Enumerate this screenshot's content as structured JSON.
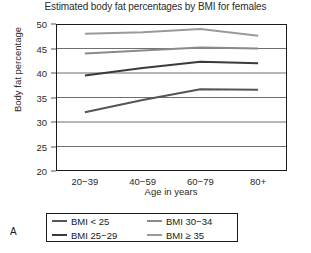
{
  "panel": {
    "letter": "A"
  },
  "chart_data": {
    "type": "line",
    "title": "Estimated body fat percentages by BMI for females",
    "xlabel": "Age in years",
    "ylabel": "Body fat percentage",
    "categories": [
      "20−39",
      "40−59",
      "60−79",
      "80+"
    ],
    "ylim": [
      20,
      50
    ],
    "yticks": [
      20,
      25,
      30,
      35,
      40,
      45,
      50
    ],
    "grid": "horizontal",
    "legend_position": "below-axes",
    "series": [
      {
        "name": "BMI < 25",
        "values": [
          32.0,
          34.5,
          36.7,
          36.6
        ],
        "color": "#555555"
      },
      {
        "name": "BMI 25−29",
        "values": [
          39.5,
          41.0,
          42.3,
          42.0
        ],
        "color": "#3a3a3a"
      },
      {
        "name": "BMI 30−34",
        "values": [
          44.0,
          44.6,
          45.2,
          45.0
        ],
        "color": "#8a8a8a"
      },
      {
        "name": "BMI ≥ 35",
        "values": [
          48.0,
          48.3,
          49.0,
          47.6
        ],
        "color": "#9a9a9a"
      }
    ]
  }
}
